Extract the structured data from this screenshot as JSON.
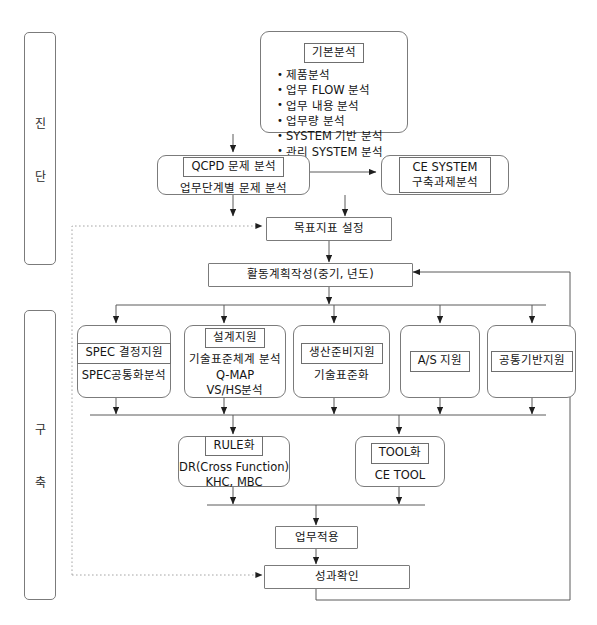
{
  "diagram": {
    "phases": [
      {
        "id": "phase-diagnosis",
        "chars": [
          "진",
          "단"
        ]
      },
      {
        "id": "phase-build",
        "chars": [
          "구",
          "축"
        ]
      }
    ],
    "nodes": {
      "basic_analysis": {
        "cap": "기본분석",
        "bullets": [
          "제품분석",
          "업무 FLOW 분석",
          "업무 내용 분석",
          "업무량 분석",
          "SYSTEM 기반 분석",
          "관리 SYSTEM 분석"
        ]
      },
      "qcpd": {
        "cap": "QCPD 문제 분석",
        "sub": "업무단계별 문제 분석"
      },
      "ce_system": {
        "line1": "CE SYSTEM",
        "line2": "구축과제분석"
      },
      "goal": {
        "label": "목표지표 설정"
      },
      "plan": {
        "label": "활동계획작성(중기, 년도)"
      },
      "spec": {
        "cap": "SPEC 결정지원",
        "sub": "SPEC공통화분석"
      },
      "design": {
        "cap": "설계지원",
        "lines": [
          "기술표준체계 분석",
          "Q-MAP",
          "VS/HS분석"
        ]
      },
      "production": {
        "cap": "생산준비지원",
        "sub": "기술표준화"
      },
      "as_support": {
        "cap": "A/S 지원"
      },
      "common_base": {
        "cap": "공통기반지원"
      },
      "rule": {
        "cap": "RULE화",
        "lines": [
          "DR(Cross Function)",
          "KHC, MBC"
        ]
      },
      "tool": {
        "cap": "TOOL화",
        "lines": [
          "CE TOOL"
        ]
      },
      "apply": {
        "label": "업무적용"
      },
      "result": {
        "label": "성과확인"
      }
    },
    "colors": {
      "stroke": "#7b7b7b",
      "stroke_dark": "#3a3a3a",
      "dotted": "#9a9a9a",
      "text": "#151515",
      "background": "#ffffff"
    }
  }
}
